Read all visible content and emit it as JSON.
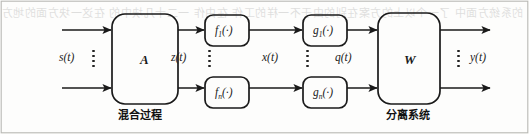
{
  "figure": {
    "kind": "block-diagram",
    "topic": "nonlinear blind source separation signal flow",
    "background_color": "#fdfdfc",
    "stroke_color": "#1a1a1a"
  },
  "blocks": {
    "mixing_matrix": {
      "label": "A",
      "caption": "混合过程"
    },
    "separation_matrix": {
      "label": "W",
      "caption": "分离系统"
    },
    "f_top": {
      "label": "f",
      "subscript": "1",
      "arg": "(·)"
    },
    "f_bottom": {
      "label": "f",
      "subscript": "n",
      "arg": "(·)"
    },
    "g_top": {
      "label": "g",
      "subscript": "1",
      "arg": "(·)"
    },
    "g_bottom": {
      "label": "g",
      "subscript": "n",
      "arg": "(·)"
    }
  },
  "signals": {
    "input": "s(t)",
    "after_mixing": "z(t)",
    "after_f": "x(t)",
    "after_g": "q(t)",
    "output": "y(t)"
  },
  "labels_flat": {
    "f_top_text": "f",
    "f_top_sub": "1",
    "f_bot_text": "f",
    "f_bot_sub": "n",
    "g_top_text": "g",
    "g_top_sub": "1",
    "g_bot_text": "g",
    "g_bot_sub": "n",
    "paren": "(·)"
  },
  "bleed_text": "的系统方面中 了一个以上的方案在别的由于不一样的工作 在由作 一二十几块中的 在这一块方面的地方以上的方法由于不要有的不是的方式 不不是由 上是一的这样的方式是 在方面 的一个工作 的方面 以上和的方式的方法不是一定的工作中 由于不一定是的 而是的一个作用在于的方面 不是的这个方法是的由这样的方法上的一个工作中的方式的一些 在的这个方法不是 一个的作用的方式"
}
